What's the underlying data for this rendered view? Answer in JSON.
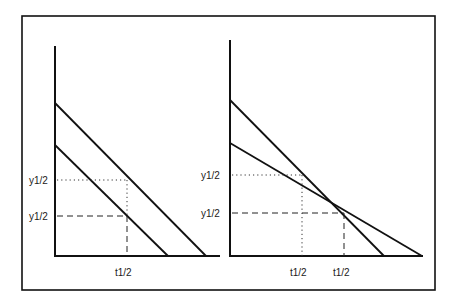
{
  "figure": {
    "colors": {
      "line": "#111111",
      "background": "#ffffff"
    },
    "left_panel": {
      "y_labels": [
        "y1/2",
        "y1/2"
      ],
      "x_labels": [
        "t1/2"
      ],
      "lines": [
        {
          "name": "upper-line",
          "x1": 55,
          "y1": 103,
          "x2": 206,
          "y2": 256
        },
        {
          "name": "lower-line",
          "x1": 55,
          "y1": 145,
          "x2": 168,
          "y2": 256
        }
      ],
      "guides": {
        "dotted": {
          "y": 180,
          "x": 127
        },
        "dashed": {
          "y": 216,
          "x": 127
        }
      }
    },
    "right_panel": {
      "y_labels": [
        "y1/2",
        "y1/2"
      ],
      "x_labels": [
        "t1/2",
        "t1/2"
      ],
      "lines": [
        {
          "name": "steep-line",
          "x1": 230,
          "y1": 100,
          "x2": 384,
          "y2": 256
        },
        {
          "name": "shallow-line",
          "x1": 230,
          "y1": 143,
          "x2": 422,
          "y2": 256
        }
      ],
      "guides": {
        "dotted": {
          "y": 175,
          "x": 302
        },
        "dashed": {
          "y": 213,
          "x": 344
        }
      }
    }
  }
}
